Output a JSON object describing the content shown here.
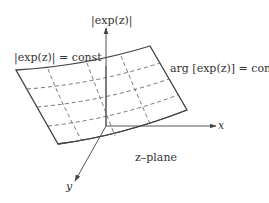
{
  "diagram": {
    "title": "",
    "colors": {
      "stroke": "#444444",
      "dashed": "#666666",
      "text": "#333333",
      "background": "#ffffff"
    },
    "labels": {
      "z_axis": "|exp(z)|",
      "x_axis": "x",
      "y_axis": "y",
      "modulus_curve": "|exp(z)| = const",
      "argument_curve": "arg [exp(z)] = const",
      "plane": "z–plane"
    },
    "nodes": [
      {
        "id": "surface",
        "label": "exp(z) surface over z-plane"
      },
      {
        "id": "z-axis",
        "label": "|exp(z)|"
      },
      {
        "id": "x-axis",
        "label": "x"
      },
      {
        "id": "y-axis",
        "label": "y"
      }
    ],
    "edges": [
      {
        "from": "origin",
        "to": "x-axis",
        "style": "arrow"
      },
      {
        "from": "origin",
        "to": "y-axis",
        "style": "arrow"
      },
      {
        "from": "origin",
        "to": "z-axis",
        "style": "arrow"
      }
    ],
    "grid": {
      "modulus_lines": 3,
      "argument_lines": 3,
      "line_style": "dashed"
    }
  }
}
